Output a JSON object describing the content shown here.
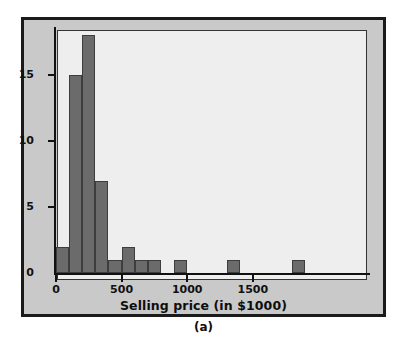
{
  "figure": {
    "panel_label": "(a)",
    "background_color": "#c9c9c9",
    "plot_background_color": "#eeeeee",
    "border_color": "#1a1a1a"
  },
  "chart_data": {
    "type": "bar",
    "subtype": "histogram",
    "title": "",
    "xlabel": "Selling price (in $1000)",
    "ylabel": "",
    "bin_width": 100,
    "bar_color": "#6b6b6b",
    "bar_edge_color": "#3d3d3d",
    "grid": false,
    "legend": null,
    "xlim": [
      -50,
      1950
    ],
    "ylim": [
      0,
      19
    ],
    "xticks": [
      0,
      500,
      1000,
      1500
    ],
    "xticklabels": [
      "0",
      "500",
      "1000",
      "1500"
    ],
    "yticks": [
      0,
      5,
      10,
      15
    ],
    "yticklabels": [
      "0",
      "5",
      "10",
      "15"
    ],
    "bins": [
      {
        "start": 0,
        "end": 100,
        "count": 2
      },
      {
        "start": 100,
        "end": 200,
        "count": 15
      },
      {
        "start": 200,
        "end": 300,
        "count": 18
      },
      {
        "start": 300,
        "end": 400,
        "count": 7
      },
      {
        "start": 400,
        "end": 500,
        "count": 1
      },
      {
        "start": 500,
        "end": 600,
        "count": 2
      },
      {
        "start": 600,
        "end": 700,
        "count": 1
      },
      {
        "start": 700,
        "end": 800,
        "count": 1
      },
      {
        "start": 800,
        "end": 900,
        "count": 0
      },
      {
        "start": 900,
        "end": 1000,
        "count": 1
      },
      {
        "start": 1000,
        "end": 1100,
        "count": 0
      },
      {
        "start": 1100,
        "end": 1200,
        "count": 0
      },
      {
        "start": 1200,
        "end": 1300,
        "count": 0
      },
      {
        "start": 1300,
        "end": 1400,
        "count": 1
      },
      {
        "start": 1400,
        "end": 1500,
        "count": 0
      },
      {
        "start": 1500,
        "end": 1600,
        "count": 0
      },
      {
        "start": 1600,
        "end": 1700,
        "count": 0
      },
      {
        "start": 1700,
        "end": 1800,
        "count": 0
      },
      {
        "start": 1800,
        "end": 1900,
        "count": 1
      }
    ],
    "categories": [
      "0-100",
      "100-200",
      "200-300",
      "300-400",
      "400-500",
      "500-600",
      "600-700",
      "700-800",
      "800-900",
      "900-1000",
      "1000-1100",
      "1100-1200",
      "1200-1300",
      "1300-1400",
      "1400-1500",
      "1500-1600",
      "1600-1700",
      "1700-1800",
      "1800-1900"
    ],
    "values": [
      2,
      15,
      18,
      7,
      1,
      2,
      1,
      1,
      0,
      1,
      0,
      0,
      0,
      1,
      0,
      0,
      0,
      0,
      1
    ]
  }
}
